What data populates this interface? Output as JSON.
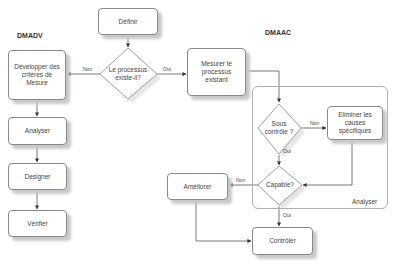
{
  "titles": {
    "left": "DMADV",
    "right": "DMAAC"
  },
  "nodes": {
    "definir": "Définir",
    "decision_exists": "Le processus existe-il?",
    "developper": "Développer des critères de Mesure",
    "analyser_left": "Analyser",
    "designer": "Designer",
    "verifier": "Vérifier",
    "mesurer": "Mesurer le processus existant",
    "sous_controle": "Sous contrôle ?",
    "eliminer": "Eliminer les causes spécifiques",
    "capable": "Capable?",
    "ameliorer": "Améliorer",
    "controler": "Contrôler"
  },
  "container": {
    "label": "Analyser"
  },
  "edge_labels": {
    "exists_no": "Non",
    "exists_yes": "Oui",
    "sous_controle_no": "Non",
    "sous_controle_yes": "Oui",
    "capable_no": "Non",
    "capable_yes": "Oui"
  }
}
